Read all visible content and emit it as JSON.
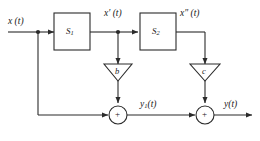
{
  "diagram": {
    "type": "block-diagram",
    "title": "",
    "colors": {
      "line": "#2b2b2b",
      "text": "#1a1a1a",
      "background": "#ffffff"
    },
    "signals": {
      "input": "x (t)",
      "intermediate_1": "x′ (t)",
      "intermediate_2": "x″ (t)",
      "partial_output": "y",
      "partial_output_sub": "1",
      "partial_output_suffix": "(t)",
      "output": "y(t)"
    },
    "blocks": [
      {
        "id": "s1",
        "label": "S",
        "subscript": "1"
      },
      {
        "id": "s2",
        "label": "S",
        "subscript": "2"
      }
    ],
    "gains": [
      {
        "id": "gain-b",
        "label": "b"
      },
      {
        "id": "gain-c",
        "label": "c"
      }
    ],
    "summers": [
      {
        "id": "summer-1",
        "label": "+"
      },
      {
        "id": "summer-2",
        "label": "+"
      }
    ]
  }
}
